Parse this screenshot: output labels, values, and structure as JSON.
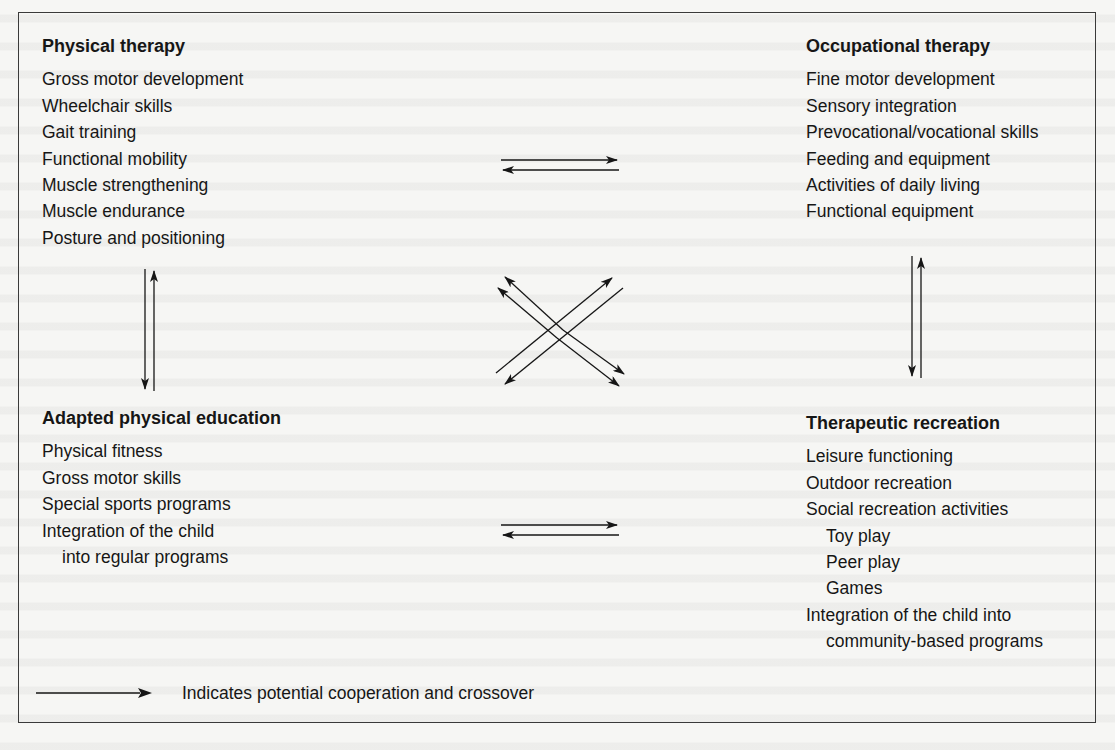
{
  "figure": {
    "blocks": {
      "physical_therapy": {
        "title": "Physical therapy",
        "items": [
          {
            "text": "Gross motor development",
            "indent": false
          },
          {
            "text": "Wheelchair skills",
            "indent": false
          },
          {
            "text": "Gait training",
            "indent": false
          },
          {
            "text": "Functional mobility",
            "indent": false
          },
          {
            "text": "Muscle strengthening",
            "indent": false
          },
          {
            "text": "Muscle endurance",
            "indent": false
          },
          {
            "text": "Posture and positioning",
            "indent": false
          }
        ]
      },
      "occupational_therapy": {
        "title": "Occupational therapy",
        "items": [
          {
            "text": "Fine motor development",
            "indent": false
          },
          {
            "text": "Sensory integration",
            "indent": false
          },
          {
            "text": "Prevocational/vocational skills",
            "indent": false
          },
          {
            "text": "Feeding and equipment",
            "indent": false
          },
          {
            "text": "Activities of daily living",
            "indent": false
          },
          {
            "text": "Functional equipment",
            "indent": false
          }
        ]
      },
      "adapted_physical_education": {
        "title": "Adapted physical education",
        "items": [
          {
            "text": "Physical fitness",
            "indent": false
          },
          {
            "text": "Gross motor skills",
            "indent": false
          },
          {
            "text": "Special sports programs",
            "indent": false
          },
          {
            "text": "Integration of the child",
            "indent": false
          },
          {
            "text": "into regular programs",
            "indent": true
          }
        ]
      },
      "therapeutic_recreation": {
        "title": "Therapeutic recreation",
        "items": [
          {
            "text": "Leisure functioning",
            "indent": false
          },
          {
            "text": "Outdoor recreation",
            "indent": false
          },
          {
            "text": "Social recreation activities",
            "indent": false
          },
          {
            "text": "Toy play",
            "indent": true
          },
          {
            "text": "Peer play",
            "indent": true
          },
          {
            "text": "Games",
            "indent": true
          },
          {
            "text": "Integration of the child into",
            "indent": false
          },
          {
            "text": "community-based programs",
            "indent": true
          }
        ]
      }
    },
    "connections": [
      {
        "from": "physical_therapy",
        "to": "occupational_therapy",
        "type": "bidirectional-pair",
        "orientation": "horizontal"
      },
      {
        "from": "adapted_physical_education",
        "to": "therapeutic_recreation",
        "type": "bidirectional-pair",
        "orientation": "horizontal"
      },
      {
        "from": "physical_therapy",
        "to": "adapted_physical_education",
        "type": "bidirectional-pair",
        "orientation": "vertical"
      },
      {
        "from": "occupational_therapy",
        "to": "therapeutic_recreation",
        "type": "bidirectional-pair",
        "orientation": "vertical"
      },
      {
        "from": "physical_therapy",
        "to": "therapeutic_recreation",
        "type": "bidirectional-pair",
        "orientation": "diagonal"
      },
      {
        "from": "occupational_therapy",
        "to": "adapted_physical_education",
        "type": "bidirectional-pair",
        "orientation": "diagonal"
      }
    ],
    "legend": {
      "icon": "right-arrow-icon",
      "text": "Indicates potential cooperation and crossover"
    },
    "colors": {
      "ink": "#161616",
      "background": "#f6f6f4",
      "frame": "#3a3a3a"
    }
  }
}
